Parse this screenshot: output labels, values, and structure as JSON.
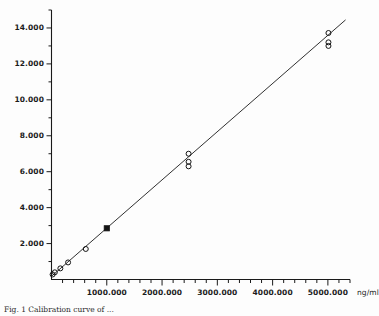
{
  "figure": {
    "background_color": "#fdfdfd",
    "foreground_color": "#1a1a1a",
    "caption_partial": "Fig. 1  Calibration curve of ..."
  },
  "axes": {
    "x_unit_label": "ng/ml",
    "x_tick_labels": [
      "1000.000",
      "2000.000",
      "3000.000",
      "4000.000",
      "5000.000"
    ],
    "y_tick_labels": [
      "2.000",
      "4.000",
      "6.000",
      "8.000",
      "10.000",
      "12.000",
      "14.000"
    ]
  },
  "chart_data": {
    "type": "scatter",
    "title": "",
    "subtitle": "",
    "xlabel": "ng/ml",
    "ylabel": "",
    "xlim": [
      0,
      5400
    ],
    "ylim": [
      0,
      15.0
    ],
    "grid": false,
    "legend": false,
    "legend_position": "none",
    "x_major_ticks": [
      1000,
      2000,
      3000,
      4000,
      5000
    ],
    "x_minor_tick_step": 200,
    "y_major_ticks": [
      2,
      4,
      6,
      8,
      10,
      12,
      14
    ],
    "y_minor_tick_step": 1,
    "x_tick_labels": [
      "1000.000",
      "2000.000",
      "3000.000",
      "4000.000",
      "5000.000"
    ],
    "y_tick_labels": [
      "2.000",
      "4.000",
      "6.000",
      "8.000",
      "10.000",
      "12.000",
      "14.000"
    ],
    "series": [
      {
        "name": "open-circle-samples",
        "marker": "open-circle",
        "points": [
          {
            "x": 20,
            "y": 0.28
          },
          {
            "x": 60,
            "y": 0.4
          },
          {
            "x": 160,
            "y": 0.62
          },
          {
            "x": 300,
            "y": 0.95
          },
          {
            "x": 620,
            "y": 1.7
          },
          {
            "x": 2480,
            "y": 7.0
          },
          {
            "x": 2480,
            "y": 6.55
          },
          {
            "x": 2480,
            "y": 6.3
          },
          {
            "x": 5010,
            "y": 13.72
          },
          {
            "x": 5010,
            "y": 13.2
          },
          {
            "x": 5010,
            "y": 13.0
          }
        ]
      },
      {
        "name": "filled-square-sample",
        "marker": "filled-square",
        "points": [
          {
            "x": 1000,
            "y": 2.85
          }
        ]
      }
    ],
    "fit_line": {
      "name": "linear-regression-line",
      "x_start": 0,
      "y_start": 0.18,
      "x_end": 5320,
      "y_end": 14.45
    }
  }
}
